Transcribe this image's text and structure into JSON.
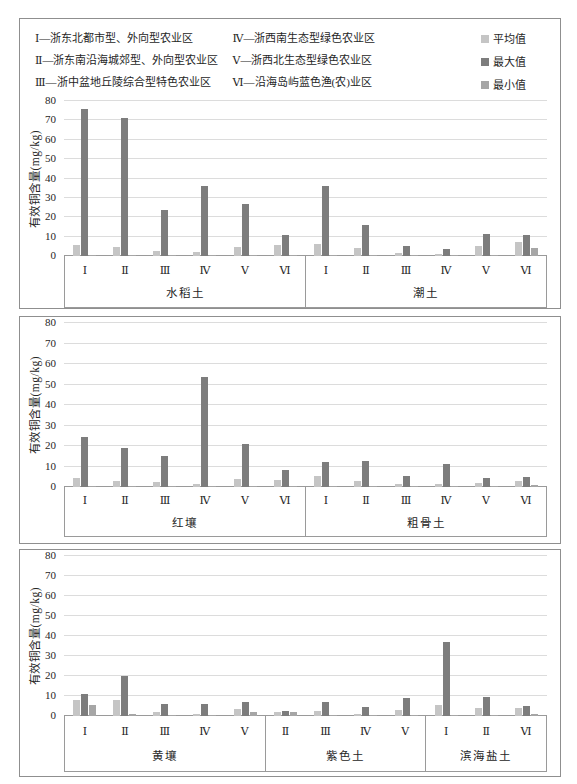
{
  "legend": {
    "zones": [
      "Ⅰ—浙东北都市型、外向型农业区",
      "Ⅱ—浙东南沿海城郊型、外向型农业区",
      "Ⅲ—浙中盆地丘陵综合型特色农业区",
      "Ⅳ—浙西南生态型绿色农业区",
      "Ⅴ—浙西北生态型绿色农业区",
      "Ⅵ—沿海岛屿蓝色渔(农)业区"
    ],
    "series": [
      {
        "key": "avg",
        "name": "平均值",
        "color": "#c5c5c5"
      },
      {
        "key": "max",
        "name": "最大值",
        "color": "#7d7d7d"
      },
      {
        "key": "min",
        "name": "最小值",
        "color": "#a6a6a6"
      }
    ]
  },
  "chart_data": [
    {
      "type": "bar",
      "title": "",
      "xlabel": "",
      "ylabel": "有效铜含量(mg/kg)",
      "ylim": [
        0,
        80
      ],
      "yticks": [
        0,
        10,
        20,
        30,
        40,
        50,
        60,
        70,
        80
      ],
      "grid": true,
      "legend_position": "top-right",
      "series_names": [
        "平均值",
        "最大值",
        "最小值"
      ],
      "groups": [
        {
          "soil": "水稻土",
          "zones": [
            {
              "zone": "Ⅰ",
              "avg": 5.5,
              "max": 76,
              "min": 0.5
            },
            {
              "zone": "Ⅱ",
              "avg": 4.5,
              "max": 71,
              "min": 0.4
            },
            {
              "zone": "Ⅲ",
              "avg": 2.5,
              "max": 24,
              "min": 0.3
            },
            {
              "zone": "Ⅳ",
              "avg": 2,
              "max": 36,
              "min": 0.3
            },
            {
              "zone": "Ⅴ",
              "avg": 4.5,
              "max": 27,
              "min": 0.4
            },
            {
              "zone": "Ⅵ",
              "avg": 5.5,
              "max": 11,
              "min": 0.5
            }
          ]
        },
        {
          "soil": "潮土",
          "zones": [
            {
              "zone": "Ⅰ",
              "avg": 6,
              "max": 36,
              "min": 0.5
            },
            {
              "zone": "Ⅱ",
              "avg": 4,
              "max": 16,
              "min": 0.4
            },
            {
              "zone": "Ⅲ",
              "avg": 1.5,
              "max": 5,
              "min": 0.3
            },
            {
              "zone": "Ⅳ",
              "avg": 1,
              "max": 3.5,
              "min": 0.3
            },
            {
              "zone": "Ⅴ",
              "avg": 5,
              "max": 11.5,
              "min": 0.5
            },
            {
              "zone": "Ⅵ",
              "avg": 7,
              "max": 11,
              "min": 4
            }
          ]
        }
      ]
    },
    {
      "type": "bar",
      "title": "",
      "xlabel": "",
      "ylabel": "有效铜含量(mg/kg)",
      "ylim": [
        0,
        80
      ],
      "yticks": [
        0,
        10,
        20,
        30,
        40,
        50,
        60,
        70,
        80
      ],
      "grid": true,
      "series_names": [
        "平均值",
        "最大值",
        "最小值"
      ],
      "groups": [
        {
          "soil": "红壤",
          "zones": [
            {
              "zone": "Ⅰ",
              "avg": 4.5,
              "max": 24.5,
              "min": 0.4
            },
            {
              "zone": "Ⅱ",
              "avg": 3,
              "max": 19,
              "min": 0.3
            },
            {
              "zone": "Ⅲ",
              "avg": 2.5,
              "max": 15,
              "min": 0.3
            },
            {
              "zone": "Ⅳ",
              "avg": 1.5,
              "max": 53.5,
              "min": 0.3
            },
            {
              "zone": "Ⅴ",
              "avg": 4,
              "max": 21,
              "min": 0.4
            },
            {
              "zone": "Ⅵ",
              "avg": 3.5,
              "max": 8.5,
              "min": 0.5
            }
          ]
        },
        {
          "soil": "粗骨土",
          "zones": [
            {
              "zone": "Ⅰ",
              "avg": 5.5,
              "max": 12,
              "min": 0.4
            },
            {
              "zone": "Ⅱ",
              "avg": 3,
              "max": 12.5,
              "min": 0.3
            },
            {
              "zone": "Ⅲ",
              "avg": 1.5,
              "max": 5.5,
              "min": 0.3
            },
            {
              "zone": "Ⅳ",
              "avg": 1.5,
              "max": 11,
              "min": 0.3
            },
            {
              "zone": "Ⅴ",
              "avg": 2,
              "max": 4.5,
              "min": 0.4
            },
            {
              "zone": "Ⅵ",
              "avg": 3,
              "max": 5,
              "min": 1
            }
          ]
        }
      ]
    },
    {
      "type": "bar",
      "title": "",
      "xlabel": "",
      "ylabel": "有效铜含量(mg/kg)",
      "ylim": [
        0,
        80
      ],
      "yticks": [
        0,
        10,
        20,
        30,
        40,
        50,
        60,
        70,
        80
      ],
      "grid": true,
      "series_names": [
        "平均值",
        "最大值",
        "最小值"
      ],
      "groups": [
        {
          "soil": "黄壤",
          "zones": [
            {
              "zone": "Ⅰ",
              "avg": 8,
              "max": 11,
              "min": 5.5
            },
            {
              "zone": "Ⅱ",
              "avg": 8,
              "max": 20,
              "min": 0.8
            },
            {
              "zone": "Ⅲ",
              "avg": 2,
              "max": 6,
              "min": 0.3
            },
            {
              "zone": "Ⅳ",
              "avg": 1,
              "max": 6,
              "min": 0.3
            },
            {
              "zone": "Ⅴ",
              "avg": 3.5,
              "max": 7,
              "min": 2
            }
          ]
        },
        {
          "soil": "紫色土",
          "zones": [
            {
              "zone": "Ⅱ",
              "avg": 2,
              "max": 2.5,
              "min": 2
            },
            {
              "zone": "Ⅲ",
              "avg": 2.5,
              "max": 7,
              "min": 0.3
            },
            {
              "zone": "Ⅳ",
              "avg": 1,
              "max": 4.5,
              "min": 0.3
            },
            {
              "zone": "Ⅴ",
              "avg": 3,
              "max": 9,
              "min": 0.4
            }
          ]
        },
        {
          "soil": "滨海盐土",
          "zones": [
            {
              "zone": "Ⅰ",
              "avg": 5.5,
              "max": 37,
              "min": 0.5
            },
            {
              "zone": "Ⅱ",
              "avg": 4,
              "max": 9.5,
              "min": 0.4
            },
            {
              "zone": "Ⅵ",
              "avg": 4,
              "max": 5,
              "min": 1
            }
          ]
        }
      ]
    }
  ]
}
